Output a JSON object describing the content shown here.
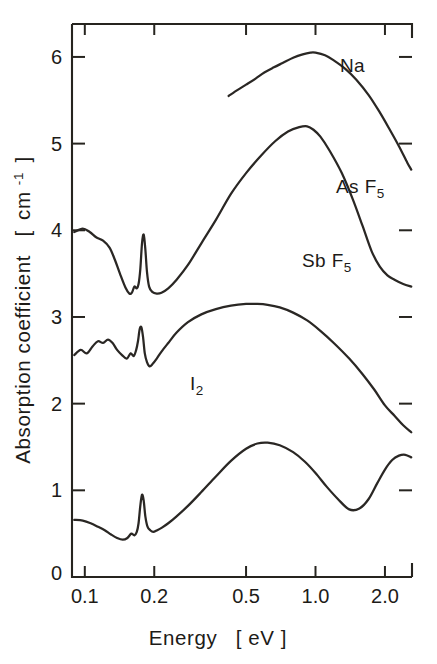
{
  "figure": {
    "background_color": "#ffffff",
    "ink_color": "#26241f"
  },
  "axes": {
    "x": {
      "title_main": "Energy",
      "title_unit": "[ eV ]",
      "scale": "log",
      "tick_labels": [
        "0.1",
        "0.2",
        "0.5",
        "1.0",
        "2.0"
      ],
      "tick_values": [
        0.1,
        0.2,
        0.5,
        1.0,
        2.0
      ],
      "range": [
        0.088,
        2.62
      ]
    },
    "y": {
      "title_main": "Absorption coefficient",
      "title_unit_open": "[",
      "title_unit_base": "cm",
      "title_unit_exp": "-1",
      "title_unit_close": "]",
      "tick_labels": [
        "0",
        "1",
        "2",
        "3",
        "4",
        "5",
        "6"
      ],
      "tick_values": [
        0,
        1,
        2,
        3,
        4,
        5,
        6
      ],
      "range": [
        0,
        6.38
      ]
    }
  },
  "series_labels": [
    {
      "name": "na-label",
      "text": "Na",
      "x": 340,
      "y": 72
    },
    {
      "name": "asf5-label",
      "text_base": "As F",
      "text_sub": "5",
      "x": 336,
      "y": 193
    },
    {
      "name": "sbf5-label",
      "text_base": "Sb F",
      "text_sub": "5",
      "x": 302,
      "y": 267
    },
    {
      "name": "i2-label",
      "text_base": "I",
      "text_sub": "2",
      "x": 190,
      "y": 390
    }
  ],
  "chart_data": {
    "type": "line",
    "title": "",
    "xlabel": "Energy [eV]",
    "ylabel": "Absorption coefficient [cm-1]",
    "xscale": "log",
    "xlim": [
      0.088,
      2.62
    ],
    "ylim": [
      0,
      6.38
    ],
    "xticks": [
      0.1,
      0.2,
      0.5,
      1.0,
      2.0
    ],
    "xticklabels": [
      "0.1",
      "0.2",
      "0.5",
      "1.0",
      "2.0"
    ],
    "yticks": [
      0,
      1,
      2,
      3,
      4,
      5,
      6
    ],
    "yticklabels": [
      "0",
      "1",
      "2",
      "3",
      "4",
      "5",
      "6"
    ],
    "grid": false,
    "legend": "inline-annotations",
    "note": "Four vertically offset absorption spectra of doped polyacetylene; y values include arbitrary vertical offsets per curve.",
    "series": [
      {
        "name": "Na",
        "label": "Na",
        "x": [
          0.42,
          0.46,
          0.5,
          0.55,
          0.6,
          0.66,
          0.72,
          0.8,
          0.88,
          0.95,
          1.0,
          1.1,
          1.2,
          1.35,
          1.5,
          1.7,
          1.9,
          2.1,
          2.3,
          2.5,
          2.6
        ],
        "y": [
          5.55,
          5.62,
          5.68,
          5.75,
          5.82,
          5.88,
          5.93,
          5.99,
          6.03,
          6.05,
          6.05,
          6.02,
          5.96,
          5.86,
          5.74,
          5.56,
          5.36,
          5.16,
          4.97,
          4.78,
          4.7
        ]
      },
      {
        "name": "AsF5",
        "label": "As F5",
        "x": [
          0.09,
          0.098,
          0.105,
          0.112,
          0.12,
          0.128,
          0.135,
          0.142,
          0.15,
          0.156,
          0.16,
          0.164,
          0.168,
          0.171,
          0.174,
          0.177,
          0.18,
          0.183,
          0.186,
          0.19,
          0.196,
          0.205,
          0.215,
          0.23,
          0.25,
          0.28,
          0.32,
          0.37,
          0.43,
          0.5,
          0.58,
          0.67,
          0.76,
          0.85,
          0.92,
          0.98,
          1.05,
          1.15,
          1.3,
          1.45,
          1.6,
          1.75,
          1.9,
          2.05,
          2.2,
          2.4,
          2.6
        ],
        "y": [
          3.98,
          4.02,
          3.98,
          3.92,
          3.88,
          3.8,
          3.66,
          3.5,
          3.34,
          3.27,
          3.28,
          3.35,
          3.33,
          3.38,
          3.55,
          3.85,
          3.95,
          3.78,
          3.52,
          3.35,
          3.29,
          3.27,
          3.28,
          3.33,
          3.43,
          3.6,
          3.85,
          4.12,
          4.42,
          4.66,
          4.86,
          5.03,
          5.14,
          5.19,
          5.2,
          5.16,
          5.08,
          4.92,
          4.66,
          4.36,
          4.05,
          3.76,
          3.58,
          3.48,
          3.43,
          3.38,
          3.35
        ]
      },
      {
        "name": "SbF5",
        "label": "Sb F5",
        "x": [
          0.09,
          0.096,
          0.102,
          0.108,
          0.114,
          0.12,
          0.126,
          0.132,
          0.138,
          0.145,
          0.152,
          0.158,
          0.163,
          0.167,
          0.17,
          0.173,
          0.176,
          0.179,
          0.182,
          0.186,
          0.191,
          0.197,
          0.205,
          0.215,
          0.23,
          0.25,
          0.28,
          0.32,
          0.37,
          0.43,
          0.5,
          0.56,
          0.62,
          0.7,
          0.8,
          0.92,
          1.05,
          1.2,
          1.4,
          1.6,
          1.8,
          2.0,
          2.2,
          2.4,
          2.6
        ],
        "y": [
          2.56,
          2.62,
          2.58,
          2.66,
          2.72,
          2.7,
          2.74,
          2.7,
          2.62,
          2.56,
          2.52,
          2.58,
          2.55,
          2.62,
          2.72,
          2.86,
          2.88,
          2.76,
          2.58,
          2.48,
          2.43,
          2.46,
          2.52,
          2.6,
          2.7,
          2.82,
          2.94,
          3.03,
          3.09,
          3.13,
          3.15,
          3.15,
          3.14,
          3.11,
          3.05,
          2.96,
          2.84,
          2.7,
          2.52,
          2.34,
          2.16,
          1.98,
          1.86,
          1.75,
          1.67
        ]
      },
      {
        "name": "I2",
        "label": "I2",
        "x": [
          0.09,
          0.098,
          0.106,
          0.114,
          0.122,
          0.13,
          0.138,
          0.146,
          0.153,
          0.159,
          0.164,
          0.168,
          0.171,
          0.174,
          0.177,
          0.18,
          0.183,
          0.187,
          0.192,
          0.198,
          0.206,
          0.216,
          0.23,
          0.25,
          0.28,
          0.32,
          0.37,
          0.43,
          0.5,
          0.56,
          0.62,
          0.7,
          0.8,
          0.9,
          1.0,
          1.12,
          1.25,
          1.4,
          1.55,
          1.7,
          1.85,
          2.0,
          2.15,
          2.3,
          2.45,
          2.6
        ],
        "y": [
          0.66,
          0.65,
          0.62,
          0.58,
          0.54,
          0.49,
          0.45,
          0.43,
          0.45,
          0.5,
          0.48,
          0.52,
          0.62,
          0.82,
          0.95,
          0.88,
          0.7,
          0.58,
          0.54,
          0.52,
          0.54,
          0.57,
          0.62,
          0.7,
          0.82,
          0.98,
          1.16,
          1.34,
          1.48,
          1.54,
          1.55,
          1.52,
          1.44,
          1.33,
          1.2,
          1.04,
          0.9,
          0.78,
          0.79,
          0.9,
          1.08,
          1.24,
          1.35,
          1.4,
          1.41,
          1.38
        ]
      }
    ]
  }
}
